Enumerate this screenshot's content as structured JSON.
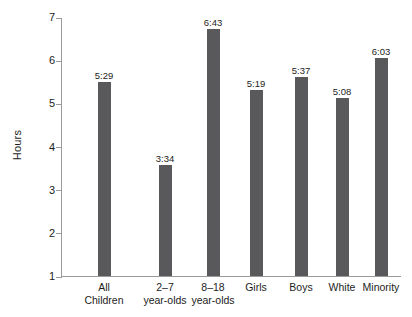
{
  "chart_data": {
    "type": "bar",
    "title": "",
    "xlabel": "",
    "ylabel": "Hours",
    "ylim": [
      1,
      7
    ],
    "yticks": [
      "7",
      "6",
      "5",
      "4",
      "3",
      "2",
      "1"
    ],
    "grid": false,
    "legend": "none",
    "bar_color": "#59595b",
    "axis_color": "#9a9a9a",
    "categories": [
      "All Children",
      "2–7 year-olds",
      "8–18 year-olds",
      "Girls",
      "Boys",
      "White",
      "Minority"
    ],
    "category_lines": [
      [
        "All",
        "Children"
      ],
      [
        "2–7",
        "year-olds"
      ],
      [
        "8–18",
        "year-olds"
      ],
      [
        "Girls",
        ""
      ],
      [
        "Boys",
        ""
      ],
      [
        "White",
        ""
      ],
      [
        "Minority",
        ""
      ]
    ],
    "data_labels": [
      "5:29",
      "3:34",
      "6:43",
      "5:19",
      "5:37",
      "5:08",
      "6:03"
    ],
    "values": [
      5.483,
      3.567,
      6.717,
      5.317,
      5.617,
      5.133,
      6.05
    ]
  }
}
